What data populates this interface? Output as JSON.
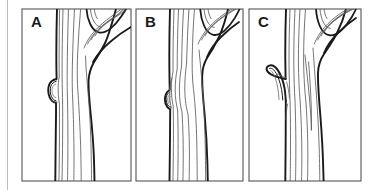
{
  "figure": {
    "type": "line-drawing",
    "background_color": "#ffffff",
    "line_color": "#1a1a1a",
    "thin_line_color": "#555555",
    "border_color": "#4d4d4d",
    "left_rule_color": "#b0b0b0",
    "panel_count": 3
  },
  "panels": [
    {
      "id": "panel-a",
      "label": "A",
      "caption": "",
      "frame": {
        "x": 22,
        "y": 9,
        "width": 109,
        "height": 172
      },
      "feature": "dormant-bud",
      "feature_position": {
        "x": 47,
        "y": 90
      }
    },
    {
      "id": "panel-b",
      "label": "B",
      "caption": "",
      "frame": {
        "x": 136,
        "y": 9,
        "width": 107,
        "height": 172
      },
      "feature": "embedded-knot",
      "feature_position": {
        "x": 167,
        "y": 95
      }
    },
    {
      "id": "panel-c",
      "label": "C",
      "caption": "",
      "frame": {
        "x": 249,
        "y": 9,
        "width": 112,
        "height": 172
      },
      "feature": "branch-stub",
      "feature_position": {
        "x": 280,
        "y": 85
      }
    }
  ],
  "labels": {
    "a": "A",
    "b": "B",
    "c": "C"
  }
}
